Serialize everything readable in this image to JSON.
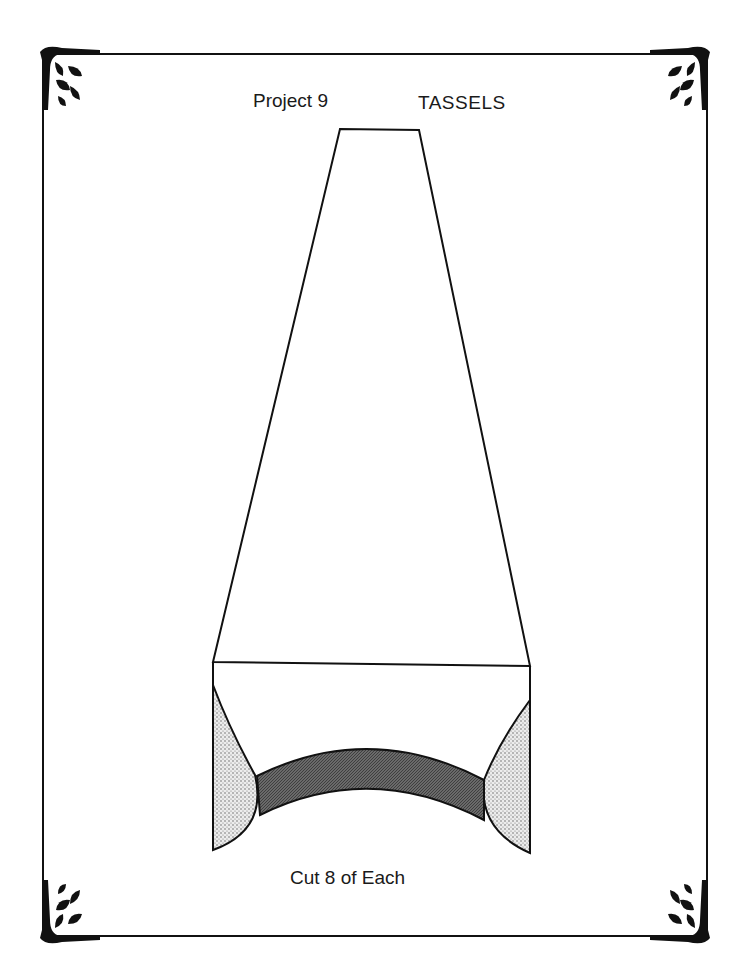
{
  "header": {
    "project_label": "Project 9",
    "project_title": "TASSELS"
  },
  "pattern": {
    "pieces": [
      {
        "name": "tassel-top-trapezoid",
        "fill": "none"
      },
      {
        "name": "tassel-bottom-band",
        "fill": "dark-shaded"
      },
      {
        "name": "tassel-left-side",
        "fill": "light-stippled"
      },
      {
        "name": "tassel-right-side",
        "fill": "light-stippled"
      }
    ]
  },
  "footer": {
    "instruction": "Cut 8 of Each"
  },
  "colors": {
    "ink": "#111111",
    "band": "#555555",
    "stipple": "#cfcfcf"
  }
}
